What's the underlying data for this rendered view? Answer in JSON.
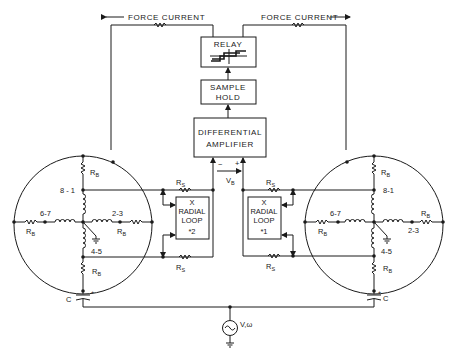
{
  "diagram": {
    "title": "",
    "force_current": {
      "left_label": "FORCE CURRENT",
      "right_label": "FORCE CURRENT"
    },
    "blocks": {
      "relay": {
        "label": "RELAY"
      },
      "sample_hold": {
        "line1": "SAMPLE",
        "line2": "HOLD"
      },
      "diff_amp": {
        "line1": "DIFFERENTIAL",
        "line2": "AMPLIFIER"
      },
      "radial_loop_2": {
        "line1": "X",
        "line2": "RADIAL",
        "line3": "LOOP",
        "line4": "*2"
      },
      "radial_loop_1": {
        "line1": "X",
        "line2": "RADIAL",
        "line3": "LOOP",
        "line4": "*1"
      }
    },
    "amp_inputs": {
      "minus": "−",
      "plus": "+",
      "vb_main": "V",
      "vb_sub": "B"
    },
    "resistors": {
      "rs_main": "R",
      "rs_sub": "S",
      "rb_main": "R",
      "rb_sub": "B"
    },
    "left_bridge": {
      "nodes": {
        "top_mid": "8 - 1",
        "left": "6-7",
        "right": "2-3",
        "bottom_mid": "4-5"
      },
      "capacitor": "C",
      "cap_polarity": "+"
    },
    "right_bridge": {
      "nodes": {
        "top_mid": "8-1",
        "left": "6-7",
        "right": "2-3",
        "bottom_mid": "4-5"
      },
      "capacitor": "C",
      "cap_polarity": "+"
    },
    "source": {
      "label": "V,ω"
    }
  }
}
